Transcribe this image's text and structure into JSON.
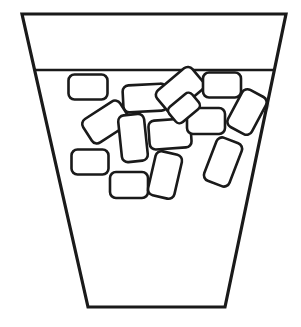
{
  "figure": {
    "title": "Blocks inside a tapered container",
    "width": 301,
    "height": 327,
    "background_color": "#ffffff",
    "line_color": "#1a1a1a",
    "shape_fill_color": "#ffffff",
    "shadow_color": "#b9b9b9"
  },
  "container": {
    "name": "tapered-container",
    "shape": "trapezoid",
    "top_left": [
      22,
      14
    ],
    "top_right": [
      286,
      14
    ],
    "bottom_right": [
      225,
      307
    ],
    "bottom_left": [
      88,
      307
    ],
    "outline_width": 3.2,
    "points": "22,14 286,14 225,307 88,307"
  },
  "fill_line": {
    "name": "contents-level-line",
    "y": 70,
    "x_start": 35,
    "x_end": 273,
    "stroke_width": 2.6
  },
  "blocks": {
    "count": 14,
    "label": "rounded rectangular blocks",
    "items": [
      {
        "id": 1,
        "name": "block-top-left",
        "cx": 88,
        "cy": 87,
        "w": 39,
        "h": 25,
        "rotation": 0,
        "radius": 6
      },
      {
        "id": 2,
        "name": "block-upper-mid-left",
        "cx": 145,
        "cy": 98,
        "w": 44,
        "h": 27,
        "rotation": -3,
        "radius": 6
      },
      {
        "id": 3,
        "name": "block-tilted-upper-mid",
        "cx": 180,
        "cy": 90,
        "w": 46,
        "h": 28,
        "rotation": -40,
        "radius": 6
      },
      {
        "id": 4,
        "name": "block-top-right",
        "cx": 222,
        "cy": 85,
        "w": 38,
        "h": 25,
        "rotation": 0,
        "radius": 6
      },
      {
        "id": 5,
        "name": "block-right-tilted",
        "cx": 247,
        "cy": 112,
        "w": 42,
        "h": 27,
        "rotation": -62,
        "radius": 6
      },
      {
        "id": 6,
        "name": "block-left-tilted",
        "cx": 106,
        "cy": 122,
        "w": 44,
        "h": 28,
        "rotation": -33,
        "radius": 6
      },
      {
        "id": 7,
        "name": "block-mid-vertical",
        "cx": 133,
        "cy": 138,
        "w": 26,
        "h": 47,
        "rotation": -6,
        "radius": 6
      },
      {
        "id": 8,
        "name": "block-center",
        "cx": 170,
        "cy": 134,
        "w": 42,
        "h": 29,
        "rotation": -4,
        "radius": 6
      },
      {
        "id": 9,
        "name": "block-mid-right",
        "cx": 206,
        "cy": 121,
        "w": 38,
        "h": 26,
        "rotation": 0,
        "radius": 6
      },
      {
        "id": 10,
        "name": "block-lower-left",
        "cx": 90,
        "cy": 162,
        "w": 37,
        "h": 25,
        "rotation": 0,
        "radius": 6
      },
      {
        "id": 11,
        "name": "block-bottom-left",
        "cx": 129,
        "cy": 185,
        "w": 38,
        "h": 26,
        "rotation": 0,
        "radius": 6
      },
      {
        "id": 12,
        "name": "block-bottom-tilted",
        "cx": 165,
        "cy": 175,
        "w": 27,
        "h": 45,
        "rotation": 13,
        "radius": 6
      },
      {
        "id": 13,
        "name": "block-right-lower",
        "cx": 223,
        "cy": 162,
        "w": 27,
        "h": 46,
        "rotation": 21,
        "radius": 6
      },
      {
        "id": 14,
        "name": "block-under-fill-line",
        "cx": 184,
        "cy": 108,
        "w": 30,
        "h": 20,
        "rotation": -40,
        "radius": 5
      }
    ]
  }
}
